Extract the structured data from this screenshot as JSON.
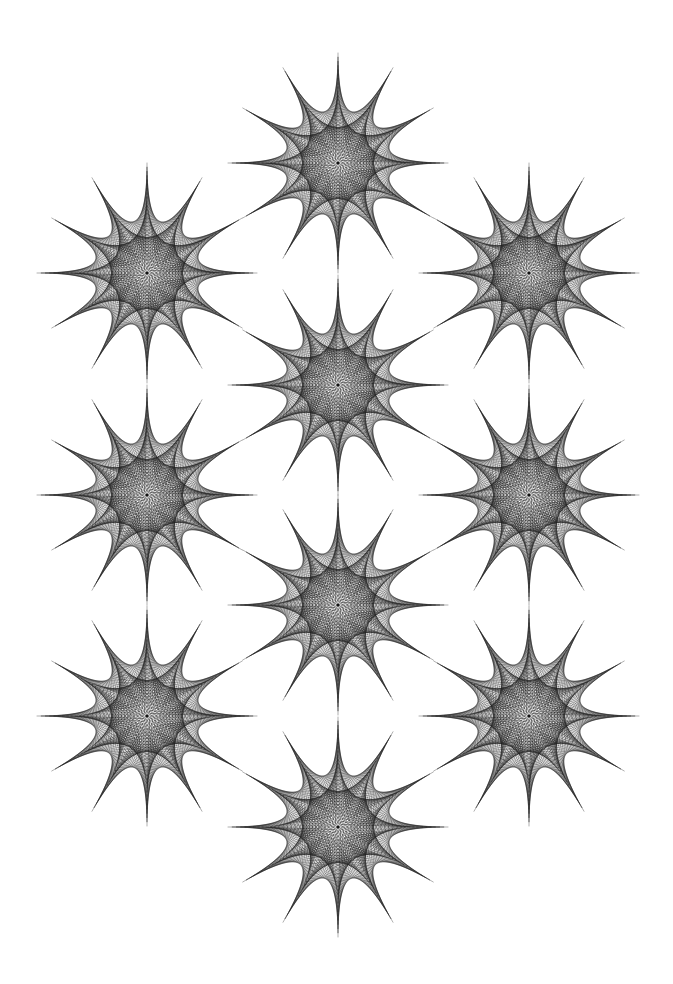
{
  "artwork": {
    "title": "",
    "background_color": "#ffffff",
    "line_color": "#1a1a1a",
    "motif": "twelve-pointed string-art star",
    "star_points": 12,
    "star_count": 10,
    "arrangement": [
      {
        "column": "left",
        "row": 1
      },
      {
        "column": "left",
        "row": 2
      },
      {
        "column": "left",
        "row": 3
      },
      {
        "column": "middle",
        "row": 0
      },
      {
        "column": "middle",
        "row": 1
      },
      {
        "column": "middle",
        "row": 2
      },
      {
        "column": "middle",
        "row": 3
      },
      {
        "column": "right",
        "row": 1
      },
      {
        "column": "right",
        "row": 2
      },
      {
        "column": "right",
        "row": 3
      }
    ]
  }
}
